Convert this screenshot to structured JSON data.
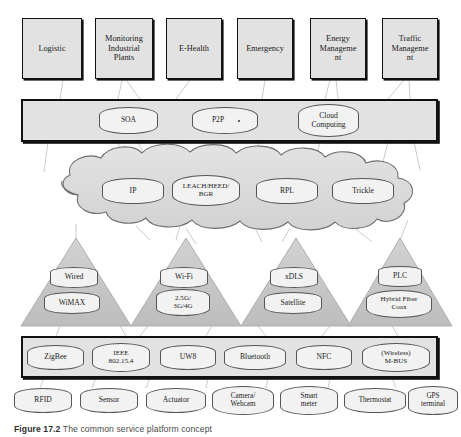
{
  "figure": {
    "caption_number": "Figure 17.2",
    "caption_text": "The common service platform concept"
  },
  "applications": {
    "layer_name": "application-layer",
    "items": [
      {
        "label": "Logistic"
      },
      {
        "label": "Monitoring\nIndustrial\nPlants"
      },
      {
        "label": "E-Health"
      },
      {
        "label": "Emergency"
      },
      {
        "label": "Energy\nManageme\nnt"
      },
      {
        "label": "Traffic\nManageme\nnt"
      }
    ]
  },
  "middleware": {
    "layer_name": "middleware-layer",
    "items": [
      {
        "label": "SOA"
      },
      {
        "label": "P2P"
      },
      {
        "label": "Cloud\nComputing"
      }
    ]
  },
  "network_cloud": {
    "layer_name": "network-routing-cloud",
    "items": [
      {
        "label": "IP"
      },
      {
        "label": "LEACH/HEED/\nBGR"
      },
      {
        "label": "RPL"
      },
      {
        "label": "Trickle"
      }
    ]
  },
  "access_triangles": {
    "layer_name": "access-network-layer",
    "items": [
      {
        "top": "Wired",
        "bottom": "WiMAX"
      },
      {
        "top": "Wi-Fi",
        "bottom": "2.5G/\n3G/4G"
      },
      {
        "top": "xDLS",
        "bottom": "Satellite"
      },
      {
        "top": "PLC",
        "bottom": "Hybrid Fiber\nCoax"
      }
    ]
  },
  "short_range": {
    "layer_name": "short-range-technology-layer",
    "items": [
      {
        "label": "ZigBee"
      },
      {
        "label": "IEEE\n802.15.4"
      },
      {
        "label": "UW8"
      },
      {
        "label": "Bluetooth"
      },
      {
        "label": "NFC"
      },
      {
        "label": "(Wireless)\nM-BUS"
      }
    ]
  },
  "devices": {
    "layer_name": "device-layer",
    "items": [
      {
        "label": "RFID"
      },
      {
        "label": "Sensor"
      },
      {
        "label": "Actuator"
      },
      {
        "label": "Camera/\nWebcam"
      },
      {
        "label": "Smart\nmeter"
      },
      {
        "label": "Thermostat"
      },
      {
        "label": "GPS\nterminal"
      }
    ]
  },
  "colors": {
    "box_fill": "#e2e2e2",
    "pill_fill": "#f2f2f2",
    "cloud_fill": "#dcdcdc",
    "triangle_fill": "#c9c9c9",
    "outline": "#111111",
    "connector": "#b8b8b8"
  }
}
